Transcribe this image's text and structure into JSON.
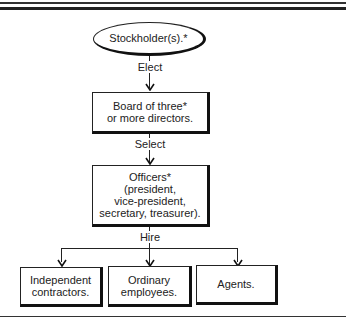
{
  "diagram": {
    "type": "org-flowchart",
    "root": {
      "label": "Stockholder(s).*",
      "shape": "ellipse"
    },
    "edges": [
      {
        "from": "Stockholder(s).*",
        "to": "Board of three* or more directors.",
        "label": "Elect"
      },
      {
        "from": "Board of three* or more directors.",
        "to": "Officers* (president, vice-president, secretary, treasurer).",
        "label": "Select"
      },
      {
        "from": "Officers* (president, vice-president, secretary, treasurer).",
        "to": [
          "Independent contractors.",
          "Ordinary employees.",
          "Agents."
        ],
        "label": "Hire"
      }
    ]
  },
  "nodes": {
    "stockholders": "Stockholder(s).*",
    "board": "Board of three*\nor more directors.",
    "officers": "Officers*\n(president,\nvice-president,\nsecretary, treasurer).",
    "contractors": "Independent\ncontractors.",
    "employees": "Ordinary\nemployees.",
    "agents": "Agents."
  },
  "edge_labels": {
    "elect": "Elect",
    "select": "Select",
    "hire": "Hire"
  }
}
